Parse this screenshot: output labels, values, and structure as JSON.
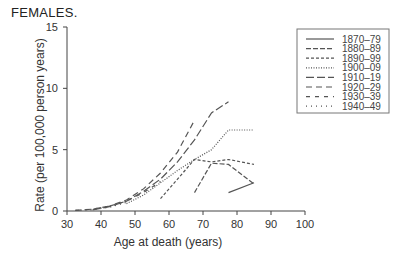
{
  "header": {
    "title": "FEMALES."
  },
  "chart_data": {
    "type": "line",
    "title": "FEMALES.",
    "xlabel": "Age at death (years)",
    "ylabel": "Rate (per 100,000 person years)",
    "xlim": [
      30,
      100
    ],
    "ylim": [
      0,
      15
    ],
    "xticks": [
      30,
      40,
      50,
      60,
      70,
      80,
      90,
      100
    ],
    "yticks": [
      0,
      5,
      10,
      15
    ],
    "grid": false,
    "legend_position": "upper right",
    "series": [
      {
        "name": "1870–79",
        "style": "solid",
        "x": [
          77.5,
          85
        ],
        "y": [
          1.5,
          2.3
        ]
      },
      {
        "name": "1880–89",
        "style": "dash",
        "x": [
          67.5,
          72.5,
          77.5,
          85
        ],
        "y": [
          1.5,
          3.9,
          3.8,
          2.2
        ]
      },
      {
        "name": "1890–99",
        "style": "short-dash",
        "x": [
          57.5,
          62.5,
          67.5,
          72.5,
          77.5,
          85
        ],
        "y": [
          1.0,
          2.6,
          4.2,
          4.0,
          4.2,
          3.8
        ]
      },
      {
        "name": "1900–09",
        "style": "dotted",
        "x": [
          47.5,
          52.5,
          57.5,
          62.5,
          67.5,
          72.5,
          77.5,
          85
        ],
        "y": [
          0.6,
          1.3,
          2.3,
          3.3,
          4.2,
          5.0,
          6.6,
          6.6
        ]
      },
      {
        "name": "1910–19",
        "style": "long-dash",
        "x": [
          37.5,
          42.5,
          47.5,
          52.5,
          57.5,
          62.5,
          67.5,
          72.5,
          77.5
        ],
        "y": [
          0.1,
          0.35,
          0.8,
          1.6,
          2.6,
          4.0,
          5.8,
          8.0,
          8.9
        ]
      },
      {
        "name": "1920–29",
        "style": "medium-dash",
        "x": [
          32.5,
          37.5,
          42.5,
          47.5,
          52.5,
          57.5,
          62.5,
          67.5
        ],
        "y": [
          0.05,
          0.15,
          0.4,
          0.9,
          1.8,
          3.1,
          4.8,
          7.4
        ]
      },
      {
        "name": "1930–39",
        "style": "sparse-dash",
        "x": [
          32.5,
          37.5,
          42.5,
          47.5,
          52.5,
          57.5
        ],
        "y": [
          0.05,
          0.15,
          0.4,
          0.8,
          1.5,
          2.4
        ]
      },
      {
        "name": "1940–49",
        "style": "sparse-dot",
        "x": [
          32.5,
          37.5,
          42.5,
          47.5
        ],
        "y": [
          0.05,
          0.1,
          0.3,
          0.7
        ]
      }
    ]
  },
  "colors": {
    "line": "#555555",
    "axis": "#444444",
    "text": "#222222"
  }
}
